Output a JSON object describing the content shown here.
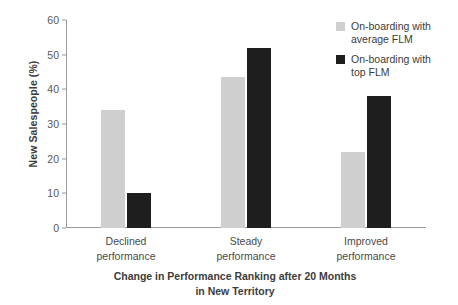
{
  "chart_data": {
    "type": "bar",
    "title": "",
    "xlabel": "Change in Performance Ranking after 20 Months in New Territory",
    "ylabel": "New Salespeople (%)",
    "ylim": [
      0,
      60
    ],
    "yticks": [
      0,
      10,
      20,
      30,
      40,
      50,
      60
    ],
    "ytick_labels": [
      "0",
      "10",
      "20",
      "30",
      "40",
      "50",
      "60"
    ],
    "grid": false,
    "legend_position": "top-right",
    "categories": [
      "Declined performance",
      "Steady performance",
      "Improved performance"
    ],
    "series": [
      {
        "name": "On-boarding with average FLM",
        "color": "#cfcfcf",
        "values": [
          34,
          43.5,
          22
        ]
      },
      {
        "name": "On-boarding with top FLM",
        "color": "#1e1e1e",
        "values": [
          10,
          52,
          38
        ]
      }
    ]
  },
  "axes": {
    "y_title": "New Salespeople (%)",
    "x_title_line1": "Change in Performance Ranking after 20 Months",
    "x_title_line2": "in New Territory",
    "x_categories": [
      {
        "line1": "Declined",
        "line2": "performance"
      },
      {
        "line1": "Steady",
        "line2": "performance"
      },
      {
        "line1": "Improved",
        "line2": "performance"
      }
    ]
  },
  "legend": {
    "items": [
      {
        "line1": "On-boarding with",
        "line2": "average FLM",
        "color": "#cfcfcf"
      },
      {
        "line1": "On-boarding with",
        "line2": "top FLM",
        "color": "#1e1e1e"
      }
    ]
  }
}
